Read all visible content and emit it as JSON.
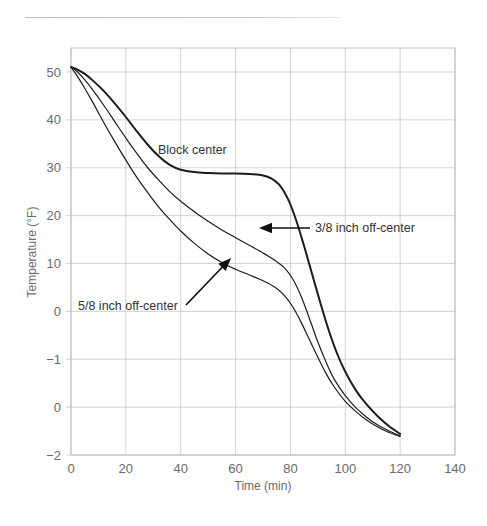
{
  "figure": {
    "has_top_rule": true,
    "background_color": "#ffffff",
    "line_color": "#1c1c1c",
    "grid_color": "#c8c8c8",
    "text_color": "#6b6b6b"
  },
  "chart_data": {
    "type": "line",
    "title": "",
    "xlabel": "Time (min)",
    "ylabel": "Temperature (°F)",
    "xlim": [
      0,
      140
    ],
    "ylim_pixels": [
      455,
      72
    ],
    "grid": true,
    "legend_position": "inline-annotations",
    "xticks": [
      0,
      20,
      40,
      60,
      80,
      100,
      120,
      140
    ],
    "xtick_labels": [
      "0",
      "20",
      "40",
      "60",
      "80",
      "100",
      "120",
      "140"
    ],
    "ytick_labels": [
      "50",
      "40",
      "30",
      "20",
      "10",
      "0",
      "−1",
      "0",
      "−2"
    ],
    "ytick_values": [
      50,
      40,
      30,
      20,
      10,
      0,
      -10,
      -20,
      -30
    ],
    "series": [
      {
        "name": "Block center",
        "label": "Block center",
        "emphasis": "thick",
        "points": [
          [
            0,
            51.0
          ],
          [
            2,
            50.6
          ],
          [
            5,
            49.6
          ],
          [
            8,
            48.2
          ],
          [
            12,
            46.0
          ],
          [
            16,
            43.4
          ],
          [
            20,
            40.6
          ],
          [
            24,
            37.6
          ],
          [
            28,
            34.8
          ],
          [
            32,
            32.4
          ],
          [
            36,
            30.6
          ],
          [
            40,
            29.6
          ],
          [
            45,
            29.1
          ],
          [
            50,
            28.9
          ],
          [
            55,
            28.8
          ],
          [
            60,
            28.8
          ],
          [
            65,
            28.7
          ],
          [
            70,
            28.4
          ],
          [
            73,
            27.8
          ],
          [
            76,
            26.4
          ],
          [
            79,
            23.6
          ],
          [
            82,
            19.2
          ],
          [
            85,
            13.6
          ],
          [
            88,
            7.6
          ],
          [
            91,
            1.6
          ],
          [
            94,
            -4.0
          ],
          [
            97,
            -8.8
          ],
          [
            100,
            -12.6
          ],
          [
            104,
            -16.6
          ],
          [
            108,
            -19.6
          ],
          [
            112,
            -22.0
          ],
          [
            116,
            -24.0
          ],
          [
            120,
            -25.6
          ]
        ]
      },
      {
        "name": "3/8 inch off-center",
        "label": "3/8 inch off-center",
        "emphasis": "thin",
        "points": [
          [
            0,
            51.0
          ],
          [
            2,
            50.2
          ],
          [
            5,
            48.4
          ],
          [
            8,
            46.2
          ],
          [
            12,
            43.0
          ],
          [
            16,
            39.6
          ],
          [
            20,
            36.2
          ],
          [
            24,
            33.0
          ],
          [
            28,
            30.0
          ],
          [
            32,
            27.4
          ],
          [
            36,
            25.0
          ],
          [
            40,
            23.0
          ],
          [
            45,
            20.8
          ],
          [
            50,
            18.8
          ],
          [
            55,
            17.0
          ],
          [
            60,
            15.4
          ],
          [
            65,
            13.8
          ],
          [
            70,
            12.2
          ],
          [
            74,
            10.8
          ],
          [
            78,
            9.0
          ],
          [
            81,
            6.6
          ],
          [
            84,
            3.0
          ],
          [
            87,
            -1.6
          ],
          [
            90,
            -6.4
          ],
          [
            93,
            -10.6
          ],
          [
            96,
            -14.2
          ],
          [
            100,
            -17.6
          ],
          [
            104,
            -20.2
          ],
          [
            108,
            -22.2
          ],
          [
            112,
            -23.8
          ],
          [
            116,
            -25.0
          ],
          [
            120,
            -26.0
          ]
        ]
      },
      {
        "name": "5/8 inch off-center",
        "label": "5/8 inch off-center",
        "emphasis": "thin",
        "points": [
          [
            0,
            51.0
          ],
          [
            2,
            49.4
          ],
          [
            5,
            46.6
          ],
          [
            8,
            43.6
          ],
          [
            12,
            39.4
          ],
          [
            16,
            35.4
          ],
          [
            20,
            31.6
          ],
          [
            24,
            28.0
          ],
          [
            28,
            24.8
          ],
          [
            32,
            21.8
          ],
          [
            36,
            19.2
          ],
          [
            40,
            16.8
          ],
          [
            45,
            14.2
          ],
          [
            50,
            12.0
          ],
          [
            55,
            10.2
          ],
          [
            60,
            8.8
          ],
          [
            65,
            7.6
          ],
          [
            70,
            6.4
          ],
          [
            75,
            4.8
          ],
          [
            78,
            3.2
          ],
          [
            81,
            0.8
          ],
          [
            84,
            -2.4
          ],
          [
            87,
            -6.0
          ],
          [
            90,
            -9.6
          ],
          [
            93,
            -13.0
          ],
          [
            96,
            -15.8
          ],
          [
            100,
            -18.8
          ],
          [
            104,
            -21.0
          ],
          [
            108,
            -22.8
          ],
          [
            112,
            -24.2
          ],
          [
            116,
            -25.3
          ],
          [
            120,
            -26.1
          ]
        ]
      }
    ],
    "annotations": [
      {
        "id": "block-center",
        "text": "Block center",
        "text_x": 158,
        "text_y": 154,
        "has_arrow": false
      },
      {
        "id": "three-eighths-off-center",
        "text": "3/8 inch off-center",
        "text_x": 315,
        "text_y": 232,
        "has_arrow": true,
        "arrow_from_x": 310,
        "arrow_from_y": 228,
        "arrow_to_x": 259,
        "arrow_to_y": 228
      },
      {
        "id": "five-eighths-off-center",
        "text": "5/8 inch off-center",
        "text_x": 78,
        "text_y": 310,
        "has_arrow": true,
        "arrow_from_x": 186,
        "arrow_from_y": 305,
        "arrow_to_x": 231,
        "arrow_to_y": 258
      }
    ]
  }
}
